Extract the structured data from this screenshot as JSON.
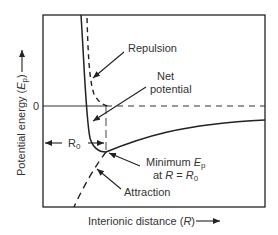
{
  "diagram": {
    "title": "",
    "y_axis_label": "Potential energy (",
    "y_axis_symbol": "E",
    "y_axis_sub": "p",
    "y_axis_close": ")",
    "x_axis_label": "Interionic distance (",
    "x_axis_symbol": "R",
    "x_axis_close": ")",
    "zero_tick": "0",
    "r0_label": "R",
    "r0_sub": "0",
    "annotations": {
      "repulsion": "Repulsion",
      "net_line1": "Net",
      "net_line2": "potential",
      "minimum_line1": "Minimum ",
      "minimum_symbol": "E",
      "minimum_sub": "p",
      "minimum_line2_at": "at ",
      "minimum_line2_R": "R",
      "minimum_line2_eq": " = ",
      "minimum_line2_R0": "R",
      "minimum_line2_R0_sub": "0",
      "attraction": "Attraction"
    },
    "curves": [
      {
        "name": "Repulsion",
        "style": "dashed"
      },
      {
        "name": "Net potential",
        "style": "solid"
      },
      {
        "name": "Attraction",
        "style": "dashed"
      }
    ],
    "colors": {
      "line": "#222222",
      "text": "#333333",
      "background": "#ffffff"
    }
  }
}
